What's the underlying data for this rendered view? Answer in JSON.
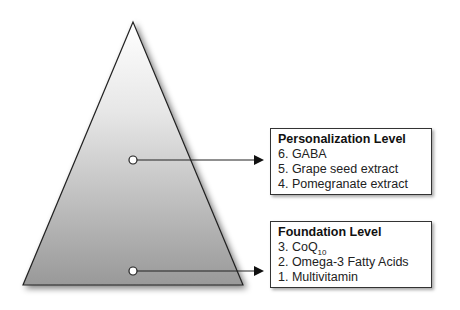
{
  "pyramid": {
    "fill_top": "#ffffff",
    "fill_bottom": "#9a9a9a",
    "stroke": "#222222"
  },
  "levels": [
    {
      "title": "Personalization Level",
      "items": [
        "6. GABA",
        "5. Grape seed extract",
        "4. Pomegranate extract"
      ]
    },
    {
      "title": "Foundation Level",
      "items": [
        "3. CoQ",
        "2. Omega-3 Fatty Acids",
        "1. Multivitamin"
      ],
      "item0_subscript": "10"
    }
  ]
}
